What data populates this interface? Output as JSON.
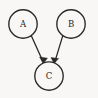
{
  "diagram": {
    "type": "directed-graph",
    "background_color": "#f8f7f6",
    "ink_color": "#2a2724",
    "canvas": {
      "width": 98,
      "height": 98
    },
    "nodes": [
      {
        "id": "A",
        "label": "A",
        "shape": "circle",
        "cx": 23,
        "cy": 24,
        "r": 14.2,
        "label_x": 23,
        "label_y": 24.3
      },
      {
        "id": "B",
        "label": "B",
        "shape": "circle",
        "cx": 71,
        "cy": 24,
        "r": 14.2,
        "label_x": 71,
        "label_y": 24.3
      },
      {
        "id": "C",
        "label": "C",
        "shape": "circle",
        "cx": 49,
        "cy": 76,
        "r": 14.2,
        "label_x": 49,
        "label_y": 76.3
      }
    ],
    "edges": [
      {
        "id": "A-to-C",
        "from": "A",
        "to": "C",
        "directed": true,
        "label": "",
        "x1": 31.2,
        "y1": 35.6,
        "x2": 43.2,
        "y2": 61.9,
        "arrow_points": "43.2,63.6 39.6,57.0 47.4,58.2"
      },
      {
        "id": "B-to-C",
        "from": "B",
        "to": "C",
        "directed": true,
        "label": "",
        "x1": 62.8,
        "y1": 35.6,
        "x2": 54.8,
        "y2": 61.9,
        "arrow_points": "54.0,63.6 51.0,57.6 58.6,58.6"
      }
    ]
  }
}
